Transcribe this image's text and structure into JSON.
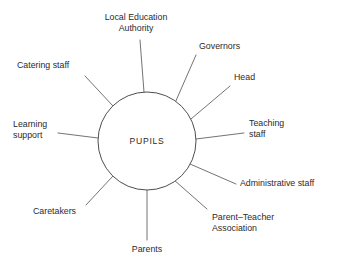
{
  "diagram": {
    "type": "radial-spoke",
    "hub": {
      "label": "PUPILS",
      "cx": 147,
      "cy": 141,
      "r": 49,
      "stroke_color": "#3a3a3a",
      "fill_color": "#ffffff"
    },
    "line_color": "#5a5a5a",
    "text_color": "#2b2b2b",
    "background_color": "#ffffff",
    "nodes": [
      {
        "label": "Local Education\nAuthority",
        "align": "center",
        "label_x": 86,
        "label_y": 12,
        "label_w": 100,
        "spoke": {
          "x1": 144,
          "y1": 92,
          "x2": 140,
          "y2": 40
        }
      },
      {
        "label": "Governors",
        "align": "left",
        "label_x": 199,
        "label_y": 41,
        "label_w": 70,
        "spoke": {
          "x1": 175,
          "y1": 103,
          "x2": 196,
          "y2": 55
        }
      },
      {
        "label": "Head",
        "align": "left",
        "label_x": 234,
        "label_y": 72,
        "label_w": 54,
        "spoke": {
          "x1": 191,
          "y1": 119,
          "x2": 230,
          "y2": 86
        }
      },
      {
        "label": "Teaching\nstaff",
        "align": "left",
        "label_x": 249,
        "label_y": 118,
        "label_w": 70,
        "spoke": {
          "x1": 196,
          "y1": 139,
          "x2": 244,
          "y2": 133
        }
      },
      {
        "label": "Administrative staff",
        "align": "left",
        "label_x": 240,
        "label_y": 178,
        "label_w": 96,
        "spoke": {
          "x1": 190,
          "y1": 164,
          "x2": 236,
          "y2": 184
        }
      },
      {
        "label": "Parent–Teacher\nAssociation",
        "align": "left",
        "label_x": 212,
        "label_y": 212,
        "label_w": 85,
        "spoke": {
          "x1": 174,
          "y1": 180,
          "x2": 207,
          "y2": 209
        }
      },
      {
        "label": "Parents",
        "align": "center",
        "label_x": 112,
        "label_y": 244,
        "label_w": 70,
        "spoke": {
          "x1": 147,
          "y1": 190,
          "x2": 147,
          "y2": 240
        }
      },
      {
        "label": "Caretakers",
        "align": "left",
        "label_x": 33,
        "label_y": 206,
        "label_w": 72,
        "spoke": {
          "x1": 113,
          "y1": 176,
          "x2": 86,
          "y2": 205
        }
      },
      {
        "label": "Learning\nsupport",
        "align": "left",
        "label_x": 13,
        "label_y": 119,
        "label_w": 64,
        "spoke": {
          "x1": 98,
          "y1": 138,
          "x2": 58,
          "y2": 133
        }
      },
      {
        "label": "Catering staff",
        "align": "left",
        "label_x": 17,
        "label_y": 60,
        "label_w": 82,
        "spoke": {
          "x1": 113,
          "y1": 106,
          "x2": 85,
          "y2": 76
        }
      }
    ],
    "bottom_caption": ""
  }
}
